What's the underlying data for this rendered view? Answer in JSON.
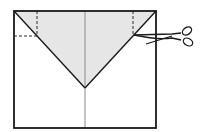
{
  "diagram": {
    "type": "paper-folding-instruction",
    "colors": {
      "background": "#ffffff",
      "stroke": "#1a1a1a",
      "flap_fill": "#e6e6e6",
      "center_line": "#8a8a8a"
    },
    "elements": [
      {
        "name": "paper-sheet",
        "shape": "rectangle"
      },
      {
        "name": "folded-flap",
        "shape": "triangle",
        "shaded": true
      },
      {
        "name": "center-crease",
        "shape": "vertical line"
      },
      {
        "name": "left-dashed-guide",
        "shape": "dashed L"
      },
      {
        "name": "right-dashed-guide",
        "shape": "dashed vertical"
      },
      {
        "name": "scissors-icon",
        "shape": "scissors",
        "meaning": "cut here"
      }
    ]
  }
}
